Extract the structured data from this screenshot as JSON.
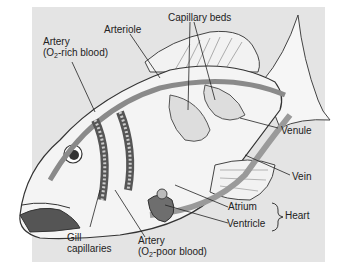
{
  "figure": {
    "labels": {
      "artery_rich_line1": "Artery",
      "artery_rich_line2_pre": "(O",
      "artery_rich_sub": "2",
      "artery_rich_line2_post": "-rich blood)",
      "arteriole": "Arteriole",
      "capillary_beds": "Capillary beds",
      "venule": "Venule",
      "vein": "Vein",
      "atrium": "Atrium",
      "ventricle": "Ventricle",
      "heart": "Heart",
      "gill_line1": "Gill",
      "gill_line2": "capillaries",
      "artery_poor_line1": "Artery",
      "artery_poor_line2_pre": "(O",
      "artery_poor_sub": "2",
      "artery_poor_line2_post": "-poor blood)"
    },
    "colors": {
      "panel": "#e4e4e4",
      "body": "#f4f4f4",
      "vessel": "#8a8a8a",
      "heart": "#6e6e6e",
      "outline": "#333333"
    }
  }
}
